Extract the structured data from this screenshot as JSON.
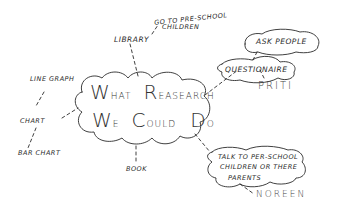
{
  "diagram": {
    "type": "mind-map",
    "style": "hand-drawn sketch",
    "central_node": {
      "line1": {
        "first": "W",
        "first_rest": "HAT",
        "second": "R",
        "second_rest": "EASEARCH"
      },
      "line2": {
        "first": "W",
        "first_rest": "E",
        "second": "C",
        "second_rest": "OULD",
        "third": "D",
        "third_rest": "O"
      },
      "full_text": "What Reasearch We Could Do"
    },
    "nodes": [
      {
        "id": "library",
        "label": "LIBRARY"
      },
      {
        "id": "go-preschool",
        "label_line1": "GO TO PRE-SCHOOL",
        "label_line2": "CHILDREN"
      },
      {
        "id": "questionaire",
        "label": "QUESTIONAIRE"
      },
      {
        "id": "ask-people",
        "label": "ASK PEOPLE"
      },
      {
        "id": "priti",
        "label": "PRITI"
      },
      {
        "id": "talk",
        "label_line1": "TALK TO PER-SCHOOL",
        "label_line2": "CHILDREN OR THERE",
        "label_line3": "PARENTS"
      },
      {
        "id": "noreen",
        "label": "NOREEN"
      },
      {
        "id": "book",
        "label": "BOOK"
      },
      {
        "id": "chart",
        "label": "CHART"
      },
      {
        "id": "line-graph",
        "label": "LINE GRAPH"
      },
      {
        "id": "bar-chart",
        "label": "BAR CHART"
      }
    ],
    "colors": {
      "ink": "#2a2a2a",
      "paper": "#ffffff"
    }
  }
}
